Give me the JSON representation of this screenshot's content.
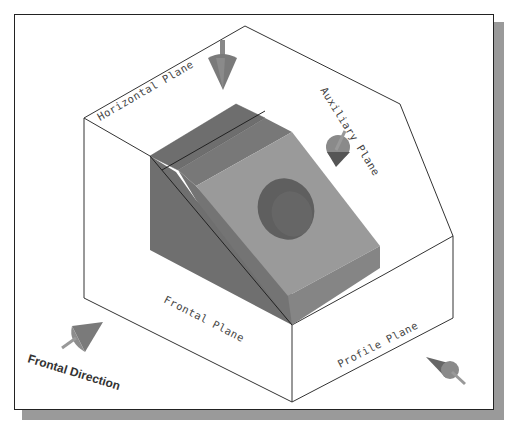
{
  "figure": {
    "title_fragment": "",
    "labels": {
      "horizontal_plane": "Horizontal Plane",
      "auxiliary_plane": "Auxiliary Plane",
      "frontal_plane": "Frontal Plane",
      "profile_plane": "Profile Plane",
      "frontal_direction": "Frontal Direction"
    },
    "colors": {
      "block_dark": "#6f6f6f",
      "block_mid": "#7d7d7d",
      "block_light": "#9a9a9a",
      "hole": "#5c5c5c",
      "arrow": "#7a7a7a",
      "line": "#333333",
      "shadow": "#9a9a9a"
    },
    "arrows": [
      {
        "name": "horizontal-view-arrow",
        "direction": "down"
      },
      {
        "name": "auxiliary-view-arrow",
        "direction": "normal-to-inclined-face"
      },
      {
        "name": "frontal-view-arrow",
        "direction": "toward-frontal-plane"
      },
      {
        "name": "profile-view-arrow",
        "direction": "toward-profile-plane"
      }
    ]
  }
}
